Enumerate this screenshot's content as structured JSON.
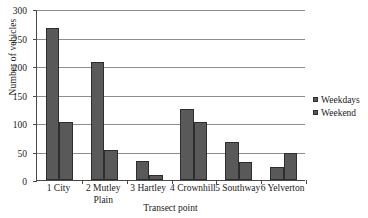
{
  "chart_data": {
    "type": "bar",
    "title": "",
    "xlabel": "Transect point",
    "ylabel": "Number of vehicles",
    "categories": [
      "1 City",
      "2 Mutley Plain",
      "3 Hartley",
      "4 Crownhill",
      "5 Southway",
      "6 Yelverton"
    ],
    "series": [
      {
        "name": "Weekdays",
        "values": [
          267,
          207,
          33,
          125,
          66,
          22
        ],
        "color": "#595959"
      },
      {
        "name": "Weekend",
        "values": [
          102,
          52,
          8,
          102,
          31,
          48
        ],
        "color": "#595959"
      }
    ],
    "ylim": [
      0,
      300
    ],
    "yticks": [
      0,
      50,
      100,
      150,
      200,
      250,
      300
    ],
    "ytick_labels": [
      "0",
      "50",
      "100",
      "150",
      "200",
      "250",
      "300"
    ],
    "grid": true,
    "legend_position": "right"
  },
  "axes": {
    "y_title": "Number of vehicles",
    "x_title": "Transect point"
  },
  "legend": {
    "entries": [
      {
        "label": "Weekdays"
      },
      {
        "label": "Weekend"
      }
    ]
  },
  "x_labels": [
    {
      "line1": "1 City",
      "line2": ""
    },
    {
      "line1": "2 Mutley",
      "line2": "Plain"
    },
    {
      "line1": "3 Hartley",
      "line2": ""
    },
    {
      "line1": "4 Crownhill",
      "line2": ""
    },
    {
      "line1": "5 Southway",
      "line2": ""
    },
    {
      "line1": "6 Yelverton",
      "line2": ""
    }
  ]
}
